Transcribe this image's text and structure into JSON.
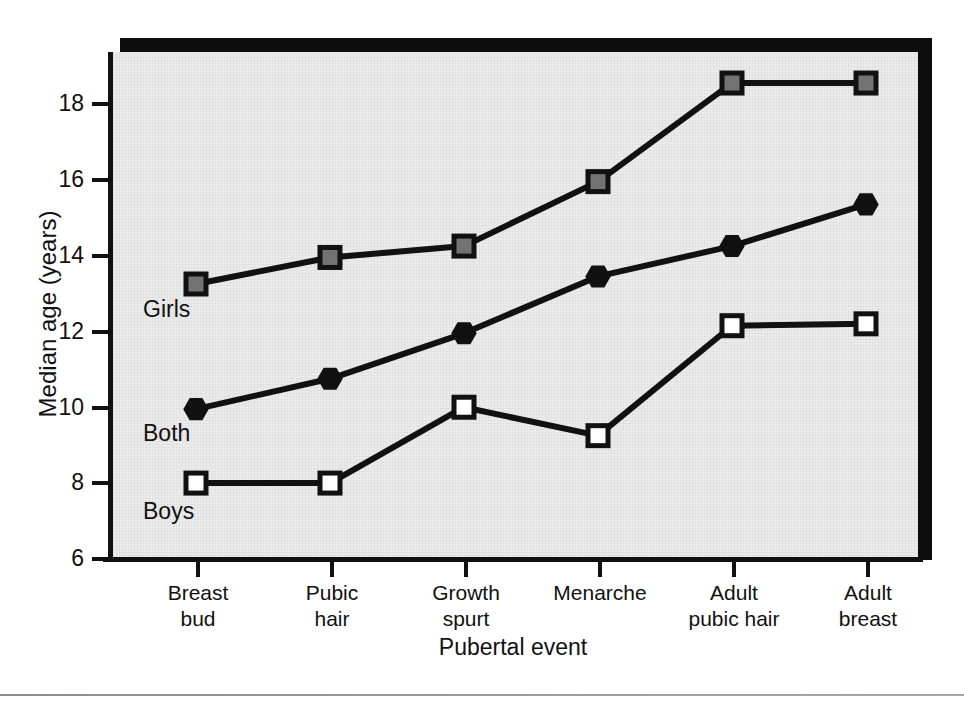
{
  "chart_data": {
    "type": "line",
    "title": "",
    "xlabel": "Pubertal event",
    "ylabel": "Median age (years)",
    "categories": [
      "Breast bud",
      "Pubic hair",
      "Growth spurt",
      "Menarche",
      "Adult pubic hair",
      "Adult breast"
    ],
    "category_lines": [
      [
        "Breast",
        "bud"
      ],
      [
        "Pubic",
        "hair"
      ],
      [
        "Growth",
        "spurt"
      ],
      [
        "Menarche",
        ""
      ],
      [
        "Adult",
        "pubic hair"
      ],
      [
        "Adult",
        "breast"
      ]
    ],
    "ylim": [
      6,
      19
    ],
    "yticks": [
      6,
      8,
      10,
      12,
      14,
      16,
      18
    ],
    "ytick_labels": [
      "6",
      "8",
      "10",
      "12",
      "14",
      "16",
      "18"
    ],
    "grid": false,
    "legend_position": "inline-annotations",
    "series": [
      {
        "name": "Girls",
        "marker": "filled-gray-square",
        "color": "#737373",
        "values": [
          13.2,
          13.9,
          14.2,
          15.9,
          18.5,
          18.5
        ]
      },
      {
        "name": "Both",
        "marker": "filled-black-hexagon",
        "color": "#111111",
        "values": [
          9.9,
          10.7,
          11.9,
          13.4,
          14.2,
          15.3
        ]
      },
      {
        "name": "Boys",
        "marker": "open-white-square",
        "color": "#ffffff",
        "values": [
          7.95,
          7.95,
          9.95,
          9.2,
          12.1,
          12.15
        ]
      }
    ],
    "annotations": [
      {
        "text": "Girls",
        "series": "Girls",
        "x_index": 0
      },
      {
        "text": "Both",
        "series": "Both",
        "x_index": 0
      },
      {
        "text": "Boys",
        "series": "Boys",
        "x_index": 0
      }
    ]
  },
  "figure": {
    "background_color": "#ececec",
    "line_color": "#111111",
    "footer_text": ""
  }
}
